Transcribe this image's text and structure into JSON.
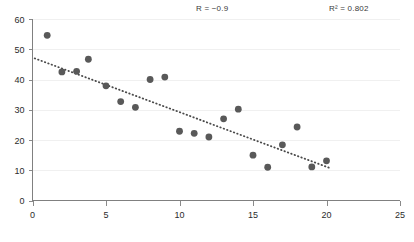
{
  "chart_data": {
    "type": "scatter",
    "title": "",
    "subtitle": "",
    "xlabel": "",
    "ylabel": "",
    "xlim": [
      0,
      25
    ],
    "ylim": [
      0,
      60
    ],
    "xticks": [
      0,
      5,
      10,
      15,
      20,
      25
    ],
    "yticks": [
      0,
      10,
      20,
      30,
      40,
      50,
      60
    ],
    "grid": "horizontal-only-faint",
    "legend": "none",
    "marker_color": "#595959",
    "trendline_color": "#4a4a4a",
    "axis_color": "#808080",
    "points": [
      {
        "x": 1,
        "y": 54.6
      },
      {
        "x": 2,
        "y": 42.5
      },
      {
        "x": 3,
        "y": 42.7
      },
      {
        "x": 3.8,
        "y": 46.7
      },
      {
        "x": 5,
        "y": 37.9
      },
      {
        "x": 6,
        "y": 32.7
      },
      {
        "x": 7,
        "y": 30.8
      },
      {
        "x": 8,
        "y": 40.0
      },
      {
        "x": 9,
        "y": 40.8
      },
      {
        "x": 10,
        "y": 22.9
      },
      {
        "x": 11,
        "y": 22.2
      },
      {
        "x": 12,
        "y": 21.0
      },
      {
        "x": 13,
        "y": 27.0
      },
      {
        "x": 14,
        "y": 30.2
      },
      {
        "x": 15,
        "y": 15.0
      },
      {
        "x": 16,
        "y": 11.0
      },
      {
        "x": 17,
        "y": 18.4
      },
      {
        "x": 18,
        "y": 24.3
      },
      {
        "x": 19,
        "y": 11.1
      },
      {
        "x": 20,
        "y": 13.1
      }
    ],
    "trendline": {
      "x0": 0.15,
      "y0": 47.0,
      "x1": 20.3,
      "y1": 10.6
    },
    "annotations": [
      {
        "name": "correlation-coefficient",
        "text": "R = −0.9"
      },
      {
        "name": "r-squared",
        "text": "R² = 0.802"
      }
    ]
  }
}
